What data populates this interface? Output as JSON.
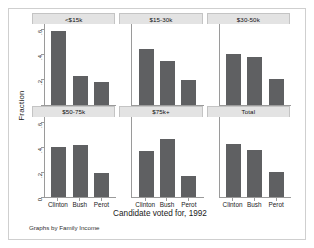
{
  "chart_data": {
    "type": "bar",
    "title": "",
    "subtitle": "",
    "xlabel": "Candidate voted for, 1992",
    "ylabel": "Fraction",
    "footnote": "Graphs by Family Income",
    "categories": [
      "Clinton",
      "Bush",
      "Perot"
    ],
    "ylim": [
      0,
      0.65
    ],
    "yticks": [
      0,
      0.2,
      0.4,
      0.6
    ],
    "ytick_labels": [
      "0",
      ".2",
      ".4",
      ".6"
    ],
    "grid": false,
    "legend": "none",
    "layout": {
      "rows": 2,
      "cols": 3
    },
    "bar_color": "#5f6062",
    "panel_strip_color": "#e3e3e3",
    "panels": [
      {
        "label": "<$15k",
        "values": [
          0.59,
          0.23,
          0.18
        ]
      },
      {
        "label": "$15-30k",
        "values": [
          0.45,
          0.35,
          0.2
        ]
      },
      {
        "label": "$30-50k",
        "values": [
          0.41,
          0.385,
          0.21
        ]
      },
      {
        "label": "$50-75k",
        "values": [
          0.4,
          0.42,
          0.19
        ]
      },
      {
        "label": "$75k+",
        "values": [
          0.37,
          0.47,
          0.17
        ]
      },
      {
        "label": "Total",
        "values": [
          0.43,
          0.38,
          0.2
        ]
      }
    ]
  }
}
